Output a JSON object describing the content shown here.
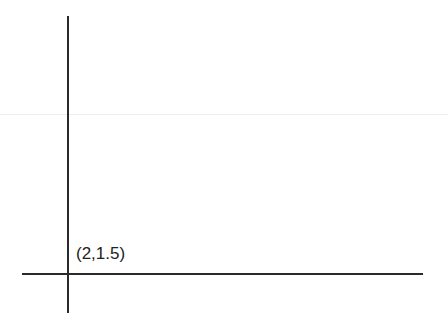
{
  "diagram": {
    "point_label": "(2,1.5)",
    "colors": {
      "axis": "#2a2a2a",
      "faint_line": "#ebebeb",
      "background": "#ffffff"
    }
  }
}
